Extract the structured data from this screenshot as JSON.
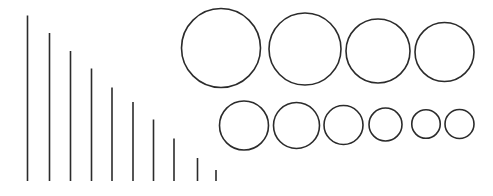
{
  "figure": {
    "background_color": "#ffffff",
    "stroke_color": "#2b2b2b",
    "canvas": {
      "width": 493,
      "height": 196
    },
    "groups": {
      "lines_label": "decreasing vertical line series",
      "circles_top_label": "top row of circles",
      "circles_bottom_label": "bottom row of circles"
    }
  },
  "chart_data": {
    "type": "scatter",
    "subtitle": "",
    "xlabel": "",
    "ylabel": "",
    "grid": false,
    "legend": "none",
    "xlim": [
      0,
      493
    ],
    "ylim": [
      0,
      196
    ],
    "series": [
      {
        "name": "vertical lines (descending length)",
        "shape": "line",
        "baseline_y": 181,
        "stroke_width": 1.6,
        "values": [
          {
            "x": 27.5,
            "y_top": 15.5,
            "length": 165.5
          },
          {
            "x": 49.5,
            "y_top": 33.0,
            "length": 148.0
          },
          {
            "x": 70.5,
            "y_top": 51.0,
            "length": 130.0
          },
          {
            "x": 91.5,
            "y_top": 68.5,
            "length": 112.5
          },
          {
            "x": 112.0,
            "y_top": 87.5,
            "length": 93.5
          },
          {
            "x": 133.0,
            "y_top": 102.0,
            "length": 79.0
          },
          {
            "x": 153.5,
            "y_top": 119.5,
            "length": 61.5
          },
          {
            "x": 174.0,
            "y_top": 138.5,
            "length": 42.5
          },
          {
            "x": 197.5,
            "y_top": 158.0,
            "length": 23.0
          },
          {
            "x": 216.0,
            "y_top": 170.0,
            "length": 11.0
          }
        ]
      },
      {
        "name": "top row circles (descending diameter)",
        "shape": "circle",
        "stroke_width": 1.6,
        "values": [
          {
            "cx": 221.0,
            "cy": 48.0,
            "d": 79.0,
            "r": 39.5
          },
          {
            "cx": 305.0,
            "cy": 49.0,
            "d": 72.0,
            "r": 36.0
          },
          {
            "cx": 378.0,
            "cy": 51.0,
            "d": 64.0,
            "r": 32.0
          },
          {
            "cx": 444.5,
            "cy": 52.0,
            "d": 59.0,
            "r": 29.5
          }
        ]
      },
      {
        "name": "bottom row circles (descending diameter)",
        "shape": "circle",
        "stroke_width": 1.6,
        "values": [
          {
            "cx": 244.0,
            "cy": 125.5,
            "d": 49.0,
            "r": 24.5
          },
          {
            "cx": 296.5,
            "cy": 125.5,
            "d": 46.0,
            "r": 23.0
          },
          {
            "cx": 343.5,
            "cy": 125.0,
            "d": 39.0,
            "r": 19.5
          },
          {
            "cx": 385.5,
            "cy": 124.5,
            "d": 33.0,
            "r": 16.5
          },
          {
            "cx": 426.0,
            "cy": 124.0,
            "d": 28.5,
            "r": 14.25
          },
          {
            "cx": 459.5,
            "cy": 124.0,
            "d": 29.0,
            "r": 14.5
          }
        ]
      }
    ]
  }
}
